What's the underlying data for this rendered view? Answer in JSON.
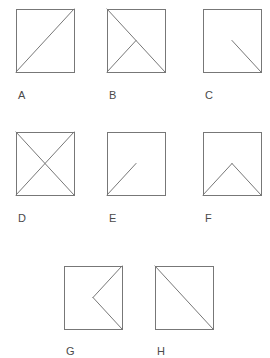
{
  "sheet": {
    "title": "Square figures with internal line segments",
    "background_color": "#ffffff",
    "stroke_color": "#777777",
    "label_color": "#4a4a4a",
    "stroke_width": 1,
    "figure_count": 8
  },
  "figures": [
    {
      "label": "A",
      "description": "square with diagonal from bottom-left corner to top-right corner",
      "x": 16,
      "y": 9,
      "width": 58,
      "height": 63,
      "label_x": 18,
      "label_y": 88,
      "lines": [
        {
          "name": "diagonal-bottom-left-to-top-right",
          "x1": 0,
          "y1": 63,
          "x2": 58,
          "y2": 0
        }
      ]
    },
    {
      "label": "B",
      "description": "square with diagonal from top-left to bottom-right and a segment from bottom-left corner to the center",
      "x": 107,
      "y": 9,
      "width": 58,
      "height": 63,
      "label_x": 109,
      "label_y": 88,
      "lines": [
        {
          "name": "diagonal-top-left-to-bottom-right",
          "x1": 0,
          "y1": 0,
          "x2": 58,
          "y2": 63
        },
        {
          "name": "segment-bottom-left-to-center",
          "x1": 0,
          "y1": 63,
          "x2": 29,
          "y2": 31.5
        }
      ]
    },
    {
      "label": "C",
      "description": "square with a segment from the center to the bottom-right corner",
      "x": 203,
      "y": 9,
      "width": 58,
      "height": 63,
      "label_x": 205,
      "label_y": 88,
      "lines": [
        {
          "name": "segment-center-to-bottom-right",
          "x1": 29,
          "y1": 31.5,
          "x2": 58,
          "y2": 63
        }
      ]
    },
    {
      "label": "D",
      "description": "square with both diagonals forming an X",
      "x": 16,
      "y": 132,
      "width": 58,
      "height": 63,
      "label_x": 18,
      "label_y": 211,
      "lines": [
        {
          "name": "diagonal-top-left-to-bottom-right",
          "x1": 0,
          "y1": 0,
          "x2": 58,
          "y2": 63
        },
        {
          "name": "diagonal-bottom-left-to-top-right",
          "x1": 0,
          "y1": 63,
          "x2": 58,
          "y2": 0
        }
      ]
    },
    {
      "label": "E",
      "description": "square with a segment from the bottom-left corner to the center",
      "x": 107,
      "y": 132,
      "width": 58,
      "height": 63,
      "label_x": 109,
      "label_y": 211,
      "lines": [
        {
          "name": "segment-bottom-left-to-center",
          "x1": 0,
          "y1": 63,
          "x2": 29,
          "y2": 31.5
        }
      ]
    },
    {
      "label": "F",
      "description": "square with a peak: bottom-left corner up to the center then down to the bottom-right corner",
      "x": 203,
      "y": 132,
      "width": 58,
      "height": 63,
      "label_x": 205,
      "label_y": 211,
      "lines": [
        {
          "name": "segment-bottom-left-to-center",
          "x1": 0,
          "y1": 63,
          "x2": 29,
          "y2": 31.5
        },
        {
          "name": "segment-center-to-bottom-right",
          "x1": 29,
          "y1": 31.5,
          "x2": 58,
          "y2": 63
        }
      ]
    },
    {
      "label": "G",
      "description": "square with a left-pointing chevron: top-right corner to the center then to the bottom-right corner",
      "x": 64,
      "y": 266,
      "width": 58,
      "height": 63,
      "label_x": 66,
      "label_y": 344,
      "lines": [
        {
          "name": "segment-top-right-to-center",
          "x1": 58,
          "y1": 0,
          "x2": 29,
          "y2": 31.5
        },
        {
          "name": "segment-center-to-bottom-right",
          "x1": 29,
          "y1": 31.5,
          "x2": 58,
          "y2": 63
        }
      ]
    },
    {
      "label": "H",
      "description": "square with diagonal from top-left corner to bottom-right corner",
      "x": 155,
      "y": 266,
      "width": 58,
      "height": 63,
      "label_x": 157,
      "label_y": 344,
      "lines": [
        {
          "name": "diagonal-top-left-to-bottom-right",
          "x1": 0,
          "y1": 0,
          "x2": 58,
          "y2": 63
        }
      ]
    }
  ]
}
